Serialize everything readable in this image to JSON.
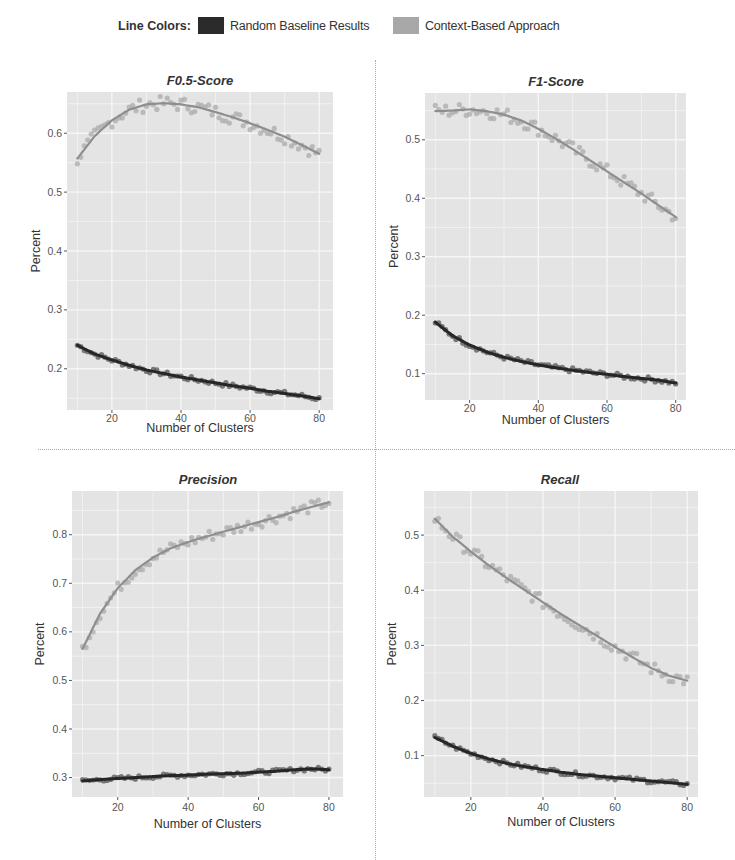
{
  "legend": {
    "title": "Line Colors:",
    "items": [
      {
        "label": "Random Baseline Results",
        "color": "#2b2b2b"
      },
      {
        "label": "Context-Based Approach",
        "color": "#a8a8a8"
      }
    ]
  },
  "colors": {
    "panel_bg": "#e4e4e4",
    "grid": "#f6f6f6",
    "baseline_line": "#262626",
    "baseline_points": "#555555",
    "context_line": "#8e8e8e",
    "context_points": "#ababab"
  },
  "chart_data": [
    {
      "type": "line",
      "title": "F0.5-Score",
      "xlabel": "Number of Clusters",
      "ylabel": "Percent",
      "xticks": [
        20,
        40,
        60,
        80
      ],
      "yticks": [
        0.2,
        0.3,
        0.4,
        0.5,
        0.6
      ],
      "xlim": [
        7,
        84
      ],
      "ylim": [
        0.13,
        0.67
      ],
      "grid": true,
      "x": [
        10,
        15,
        20,
        25,
        30,
        35,
        40,
        45,
        50,
        55,
        60,
        65,
        70,
        75,
        80
      ],
      "series": [
        {
          "name": "Random Baseline Results",
          "values": [
            0.24,
            0.225,
            0.215,
            0.206,
            0.198,
            0.192,
            0.186,
            0.181,
            0.176,
            0.171,
            0.167,
            0.162,
            0.158,
            0.154,
            0.149
          ]
        },
        {
          "name": "Context-Based Approach",
          "values": [
            0.557,
            0.595,
            0.622,
            0.64,
            0.649,
            0.651,
            0.649,
            0.644,
            0.636,
            0.627,
            0.617,
            0.606,
            0.594,
            0.58,
            0.565
          ]
        }
      ]
    },
    {
      "type": "line",
      "title": "F1-Score",
      "xlabel": "Number of Clusters",
      "ylabel": "Percent",
      "xticks": [
        20,
        40,
        60,
        80
      ],
      "yticks": [
        0.1,
        0.2,
        0.3,
        0.4,
        0.5
      ],
      "xlim": [
        7,
        83
      ],
      "ylim": [
        0.055,
        0.58
      ],
      "grid": true,
      "x": [
        10,
        15,
        20,
        25,
        30,
        35,
        40,
        45,
        50,
        55,
        60,
        65,
        70,
        75,
        80
      ],
      "series": [
        {
          "name": "Random Baseline Results",
          "values": [
            0.188,
            0.165,
            0.149,
            0.137,
            0.128,
            0.121,
            0.115,
            0.11,
            0.106,
            0.102,
            0.099,
            0.095,
            0.092,
            0.089,
            0.084
          ]
        },
        {
          "name": "Context-Based Approach",
          "values": [
            0.549,
            0.55,
            0.552,
            0.549,
            0.543,
            0.533,
            0.519,
            0.502,
            0.484,
            0.465,
            0.446,
            0.427,
            0.408,
            0.388,
            0.368
          ]
        }
      ]
    },
    {
      "type": "line",
      "title": "Precision",
      "xlabel": "Number of Clusters",
      "ylabel": "Percent",
      "xticks": [
        20,
        40,
        60,
        80
      ],
      "yticks": [
        0.3,
        0.4,
        0.5,
        0.6,
        0.7,
        0.8
      ],
      "xlim": [
        7,
        84
      ],
      "ylim": [
        0.26,
        0.89
      ],
      "grid": true,
      "x": [
        10,
        15,
        20,
        25,
        30,
        35,
        40,
        45,
        50,
        55,
        60,
        65,
        70,
        75,
        80
      ],
      "series": [
        {
          "name": "Random Baseline Results",
          "values": [
            0.293,
            0.296,
            0.298,
            0.3,
            0.302,
            0.304,
            0.305,
            0.307,
            0.308,
            0.309,
            0.311,
            0.313,
            0.316,
            0.318,
            0.316
          ]
        },
        {
          "name": "Context-Based Approach",
          "values": [
            0.565,
            0.638,
            0.69,
            0.727,
            0.753,
            0.772,
            0.785,
            0.796,
            0.806,
            0.816,
            0.826,
            0.836,
            0.847,
            0.857,
            0.867
          ]
        }
      ]
    },
    {
      "type": "line",
      "title": "Recall",
      "xlabel": "Number of Clusters",
      "ylabel": "Percent",
      "xticks": [
        20,
        40,
        60,
        80
      ],
      "yticks": [
        0.1,
        0.2,
        0.3,
        0.4,
        0.5
      ],
      "xlim": [
        7,
        83
      ],
      "ylim": [
        0.025,
        0.58
      ],
      "grid": true,
      "x": [
        10,
        15,
        20,
        25,
        30,
        35,
        40,
        45,
        50,
        55,
        60,
        65,
        70,
        75,
        80
      ],
      "series": [
        {
          "name": "Random Baseline Results",
          "values": [
            0.133,
            0.117,
            0.104,
            0.094,
            0.086,
            0.08,
            0.075,
            0.07,
            0.066,
            0.063,
            0.06,
            0.057,
            0.054,
            0.051,
            0.048
          ]
        },
        {
          "name": "Context-Based Approach",
          "values": [
            0.53,
            0.497,
            0.47,
            0.445,
            0.422,
            0.4,
            0.378,
            0.357,
            0.337,
            0.317,
            0.297,
            0.278,
            0.259,
            0.245,
            0.236
          ]
        }
      ]
    }
  ]
}
